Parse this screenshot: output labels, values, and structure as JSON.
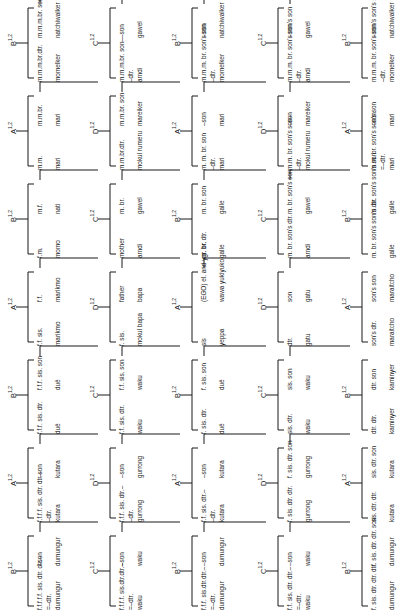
{
  "diagram": {
    "orientation": "rotated-90-ccw",
    "line_color": "#1a1a1a",
    "generations": [
      {
        "name": "generation-1",
        "units": [
          {
            "section": "B",
            "sup": "1,2",
            "left_label": "f.f.f.f.f. sis. dtr. dtr.–",
            "left_rel": "=–dtr.",
            "left_term": "dumungur",
            "right_rel": "–son",
            "right_term": "dumungur"
          },
          {
            "section": "A",
            "sup": "1,2",
            "left_label": "f.f.f.f. sis. dtr. dtr.–",
            "left_rel": "–dtr.",
            "left_term": "kutara",
            "right_rel": "–son",
            "right_term": "kutara"
          },
          {
            "section": "B",
            "sup": "1,2",
            "left_label": "f.f.f. sis. dtr.",
            "left_rel": "",
            "left_term": "dué",
            "right_rel": "f.f.f. sis. son",
            "right_term": "dué"
          },
          {
            "section": "A",
            "sup": "1,2",
            "left_label": "f.f. sis.",
            "left_rel": "",
            "left_term": "marikmo",
            "right_rel": "f.f.",
            "right_term": "marikmo"
          },
          {
            "section": "B",
            "sup": "1,2",
            "left_label": "f.m.",
            "left_rel": "",
            "left_term": "momo",
            "right_rel": "m.f.",
            "right_term": "nati"
          },
          {
            "section": "A",
            "sup": "1,2",
            "left_label": "m.m.",
            "left_rel": "",
            "left_term": "mari",
            "right_rel": "m.m.br.",
            "right_term": "mari"
          },
          {
            "section": "B",
            "sup": "1,2",
            "left_label": "m.m.m.br.dtr.",
            "left_rel": "",
            "left_term": "momelker",
            "right_rel": "m.m.m.br. son",
            "right_term": "natchiwalker"
          }
        ]
      },
      {
        "name": "generation-2",
        "units": [
          {
            "section": "C",
            "sup": "1,2",
            "left_label": "f.f.f.f. sis.dtr.dtr.–",
            "left_rel": "=–dtr.",
            "left_term": "waku",
            "right_rel": "–son",
            "right_term": "waku"
          },
          {
            "section": "D",
            "sup": "1,2",
            "left_label": "f.f.f. sis. dtr.–",
            "left_rel": "–dtr.",
            "left_term": "gurrong",
            "right_rel": "–son",
            "right_term": "gurrong"
          },
          {
            "section": "C",
            "sup": "1,2",
            "left_label": "f.f. sis. dtr.",
            "left_rel": "",
            "left_term": "waku",
            "right_rel": "f.f. sis. son",
            "right_term": "waku"
          },
          {
            "section": "D",
            "sup": "1,2",
            "left_label": "f. sis.",
            "left_rel": "",
            "left_term": "mokul bapa",
            "right_rel": "father",
            "right_term": "bapa"
          },
          {
            "section": "C",
            "sup": "1,2",
            "left_label": "mother",
            "left_rel": "",
            "left_term": "arndi",
            "right_rel": "m. br.",
            "right_term": "gawel"
          },
          {
            "section": "D",
            "sup": "1,2",
            "left_label": "m.m.br.dtr.",
            "left_rel": "",
            "left_term": "mokul rumeru",
            "right_rel": "m.m.br. son",
            "right_term": "mareiker"
          },
          {
            "section": "C",
            "sup": "1,2",
            "left_label": "m.m.m.br. son–",
            "left_rel": "–dtr.",
            "left_term": "arndi",
            "right_rel": "–son",
            "right_term": "gawel"
          }
        ]
      },
      {
        "name": "generation-3",
        "units": [
          {
            "section": "B",
            "sup": "1,2",
            "left_label": "f.f.f. sis.dtr.dtr.–",
            "left_rel": "=–dtr.",
            "left_term": "dumungur",
            "right_rel": "–son",
            "right_term": "dumungur"
          },
          {
            "section": "A",
            "sup": "1,2",
            "left_label": "f.f. sis. dtr.–",
            "left_rel": "–dtr.",
            "left_term": "kutara",
            "right_rel": "–son",
            "right_term": "kutara"
          },
          {
            "section": "B",
            "sup": "1,2",
            "left_label": "f. sis. dtr.",
            "left_rel": "",
            "left_term": "dué",
            "right_rel": "f. sis. son",
            "right_term": "dué"
          },
          {
            "section": "A",
            "sup": "1,2",
            "left_label": "sis",
            "left_rel": "",
            "left_term": "yeppa",
            "right_rel": "(EGO) el. and ygr. br.",
            "right_term": "wawa yukiyuko"
          },
          {
            "section": "B",
            "sup": "1,2",
            "left_label": "m. br. dtr.",
            "left_rel": "",
            "left_term": "galle",
            "right_rel": "m. br. son",
            "right_term": "galle"
          },
          {
            "section": "A",
            "sup": "1,2",
            "left_label": "m. m. br. son",
            "left_rel": "–dtr.",
            "left_term": "mari",
            "right_rel": "–son",
            "right_term": "mari"
          },
          {
            "section": "B",
            "sup": "1,2",
            "left_label": "m.m.m. br. son's son",
            "left_rel": "–dtr.",
            "left_term": "momelker",
            "right_rel": "–son",
            "right_term": "natchiwalker"
          }
        ]
      },
      {
        "name": "generation-4",
        "units": [
          {
            "section": "C",
            "sup": "1,2",
            "left_label": "f.f. sis. dtr. dtr.–",
            "left_rel": "=–dtr.",
            "left_term": "waku",
            "right_rel": "–son",
            "right_term": "waku"
          },
          {
            "section": "D",
            "sup": "1,2",
            "left_label": "f. sis. dtr. dtr.",
            "left_rel": "",
            "left_term": "gurrong",
            "right_rel": "f. sis. dtr. son",
            "right_term": "gurrong"
          },
          {
            "section": "C",
            "sup": "1,2",
            "left_label": "sis. dtr.",
            "left_rel": "",
            "left_term": "waku",
            "right_rel": "sis. son",
            "right_term": "waku"
          },
          {
            "section": "D",
            "sup": "1,2",
            "left_label": "dtr.",
            "left_rel": "",
            "left_term": "gatu",
            "right_rel": "son",
            "right_term": "gatu"
          },
          {
            "section": "C",
            "sup": "1,2",
            "left_label": "m. br. son's dtr.",
            "left_rel": "",
            "left_term": "arndi",
            "right_rel": "m. br. son's son",
            "right_term": "gawel"
          },
          {
            "section": "D",
            "sup": "1,2",
            "left_label": "m.m. br. son's son–",
            "left_rel": "–dtr.",
            "left_term": "mokul rumeru",
            "right_rel": "–son",
            "right_term": "mareiker"
          },
          {
            "section": "C",
            "sup": "1,2",
            "left_label": "m.m.m. br. son's son's son",
            "left_rel": "–dtr.",
            "left_term": "arndi",
            "right_rel": "–son",
            "right_term": "gawel"
          }
        ]
      },
      {
        "name": "generation-5",
        "units": [
          {
            "section": "B",
            "sup": "1,2",
            "left_label": "f. sis. dtr. dtr. dtr.",
            "left_rel": "",
            "left_term": "dumungur",
            "right_rel": "f. sis. dtr. dtr. son",
            "right_term": "dumungur"
          },
          {
            "section": "A",
            "sup": "1,2",
            "left_label": "sis. dtr. dtr.",
            "left_rel": "",
            "left_term": "kutara",
            "right_rel": "sis. dtr. son",
            "right_term": "kutara"
          },
          {
            "section": "B",
            "sup": "1,2",
            "left_label": "dtr. dtr.",
            "left_rel": "",
            "left_term": "kaminyer",
            "right_rel": "dtr. son",
            "right_term": "kaminyer"
          },
          {
            "section": "A",
            "sup": "1,2",
            "left_label": "son's dtr.",
            "left_rel": "",
            "left_term": "maraitcho",
            "right_rel": "son's son",
            "right_term": "maraitcho"
          },
          {
            "section": "B",
            "sup": "1,2",
            "left_label": "m. br. son's son's dtr.",
            "left_rel": "",
            "left_term": "galle",
            "right_rel": "m. br. son's son's son",
            "right_term": "galle"
          },
          {
            "section": "A",
            "sup": "1,2",
            "left_label": "m.m. br. son's son's son",
            "left_rel": "=–dtr.",
            "left_term": "mari",
            "right_rel": "–son",
            "right_term": "mari"
          },
          {
            "section": "B",
            "sup": "1,2",
            "left_label": "m.m.m. br. son's son's son's son",
            "left_rel": "–dtr.",
            "left_term": "momelker",
            "right_rel": "–son",
            "right_term": "natchiwalker"
          }
        ]
      }
    ]
  }
}
